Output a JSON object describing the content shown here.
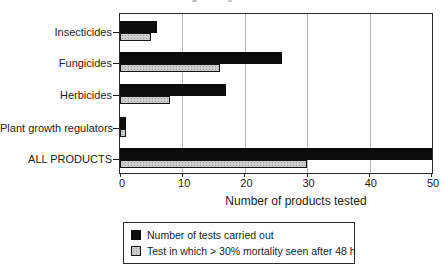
{
  "chart_data": {
    "type": "bar",
    "orientation": "horizontal",
    "categories": [
      "Insecticides",
      "Fungicides",
      "Herbicides",
      "Plant growth regulators",
      "ALL PRODUCTS"
    ],
    "series": [
      {
        "name": "Number of tests carried out",
        "color": "#0c0c0c",
        "pattern": "solid",
        "values": [
          6,
          26,
          17,
          1,
          50
        ]
      },
      {
        "name": "Test in which > 30% mortality seen after 48 h",
        "color": "#cdcdcd",
        "pattern": "stipple",
        "values": [
          5,
          16,
          8,
          1,
          30
        ]
      }
    ],
    "xlabel": "Number of products tested",
    "xlim": [
      0,
      50
    ],
    "xticks": [
      0,
      10,
      20,
      30,
      40,
      50
    ],
    "grid": "vertical-gridlines",
    "legend_position": "bottom-center"
  }
}
